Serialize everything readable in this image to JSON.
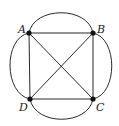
{
  "diagram": {
    "type": "graph",
    "vertices": [
      {
        "id": "A",
        "label": "A",
        "x": 29,
        "y": 33
      },
      {
        "id": "B",
        "label": "B",
        "x": 93,
        "y": 33
      },
      {
        "id": "C",
        "label": "C",
        "x": 93,
        "y": 99
      },
      {
        "id": "D",
        "label": "D",
        "x": 30,
        "y": 99
      }
    ],
    "edges": [
      {
        "from": "A",
        "to": "B",
        "style": "straight"
      },
      {
        "from": "B",
        "to": "C",
        "style": "straight"
      },
      {
        "from": "C",
        "to": "D",
        "style": "straight"
      },
      {
        "from": "D",
        "to": "A",
        "style": "straight"
      },
      {
        "from": "A",
        "to": "C",
        "style": "straight"
      },
      {
        "from": "B",
        "to": "D",
        "style": "straight"
      },
      {
        "from": "A",
        "to": "B",
        "style": "curved-outer"
      },
      {
        "from": "B",
        "to": "C",
        "style": "curved-outer"
      },
      {
        "from": "C",
        "to": "D",
        "style": "curved-outer"
      },
      {
        "from": "D",
        "to": "A",
        "style": "curved-outer"
      }
    ],
    "colors": {
      "edge": "#2a2a2a",
      "vertex": "#111111",
      "label": "#222222",
      "background": "#ffffff"
    }
  }
}
